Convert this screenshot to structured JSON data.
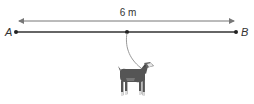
{
  "diagram": {
    "dimension_label": "6 m",
    "point_a_label": "A",
    "point_b_label": "B",
    "figure": "goat-icon",
    "colors": {
      "line": "#333333",
      "dimension_arrow": "#777777",
      "rope": "#999999",
      "goat_body": "#555555",
      "goat_head": "#e8e8e8"
    }
  }
}
